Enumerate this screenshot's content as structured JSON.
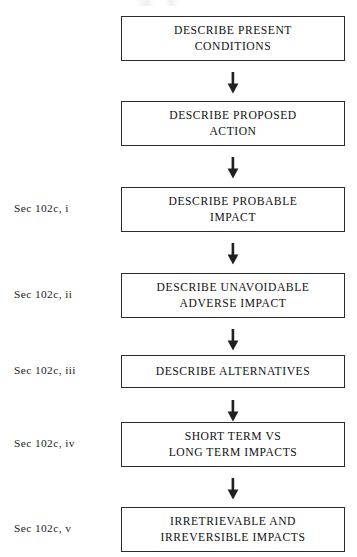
{
  "document": {
    "type": "flowchart",
    "orientation": "vertical",
    "background_color": "#ffffff",
    "box_border_color": "#2b2b2b",
    "text_color": "#111111",
    "arrow_color": "#1f1f1f",
    "arrow_glyph": "down-arrow"
  },
  "steps": [
    {
      "id": "step-1",
      "section_label": "",
      "text": "DESCRIBE PRESENT\nCONDITIONS",
      "lines": [
        "DESCRIBE PRESENT",
        "CONDITIONS"
      ],
      "size": "tall"
    },
    {
      "id": "step-2",
      "section_label": "",
      "text": "DESCRIBE PROPOSED\nACTION",
      "lines": [
        "DESCRIBE PROPOSED",
        "ACTION"
      ],
      "size": "tall"
    },
    {
      "id": "step-3",
      "section_label": "Sec 102c, i",
      "text": "DESCRIBE PROBABLE\nIMPACT",
      "lines": [
        "DESCRIBE PROBABLE",
        "IMPACT"
      ],
      "size": "tall"
    },
    {
      "id": "step-4",
      "section_label": "Sec 102c, ii",
      "text": "DESCRIBE UNAVOIDABLE\nADVERSE IMPACT",
      "lines": [
        "DESCRIBE UNAVOIDABLE",
        "ADVERSE IMPACT"
      ],
      "size": "tall"
    },
    {
      "id": "step-5",
      "section_label": "Sec 102c, iii",
      "text": "DESCRIBE ALTERNATIVES",
      "lines": [
        "DESCRIBE ALTERNATIVES"
      ],
      "size": "short"
    },
    {
      "id": "step-6",
      "section_label": "Sec 102c, iv",
      "text": "SHORT TERM VS\nLONG TERM IMPACTS",
      "lines": [
        "SHORT TERM VS",
        "LONG TERM IMPACTS"
      ],
      "size": "tall"
    },
    {
      "id": "step-7",
      "section_label": "Sec 102c, v",
      "text": "IRRETRIEVABLE AND\nIRREVERSIBLE IMPACTS",
      "lines": [
        "IRRETRIEVABLE AND",
        "IRREVERSIBLE IMPACTS"
      ],
      "size": "tall"
    }
  ],
  "connectors": [
    {
      "id": "arrow-1",
      "from": "step-1",
      "to": "step-2"
    },
    {
      "id": "arrow-2",
      "from": "step-2",
      "to": "step-3"
    },
    {
      "id": "arrow-3",
      "from": "step-3",
      "to": "step-4"
    },
    {
      "id": "arrow-4",
      "from": "step-4",
      "to": "step-5"
    },
    {
      "id": "arrow-5",
      "from": "step-5",
      "to": "step-6"
    },
    {
      "id": "arrow-6",
      "from": "step-6",
      "to": "step-7"
    }
  ]
}
